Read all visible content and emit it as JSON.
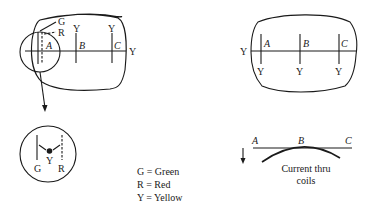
{
  "left_screen": {
    "labels": {
      "green": "G",
      "red": "R",
      "yellow_b": "Y",
      "yellow_c": "Y",
      "yellow_right": "Y",
      "point_a": "A",
      "point_b": "B",
      "point_c": "C"
    }
  },
  "inset_detail": {
    "labels": {
      "green": "G",
      "yellow": "Y",
      "red": "R"
    }
  },
  "legend": {
    "items": [
      "G = Green",
      "R = Red",
      "Y = Yellow"
    ]
  },
  "right_screen": {
    "labels": {
      "yellow_left": "Y",
      "point_a": "A",
      "point_b": "B",
      "point_c": "C",
      "yellow_a": "Y",
      "yellow_b": "Y",
      "yellow_c": "Y"
    }
  },
  "current_curve": {
    "labels": {
      "point_a": "A",
      "point_b": "B",
      "point_c": "C",
      "caption_line1": "Current thru",
      "caption_line2": "coils"
    }
  },
  "colors": {
    "ink": "#1a1a1a",
    "background": "#ffffff"
  }
}
